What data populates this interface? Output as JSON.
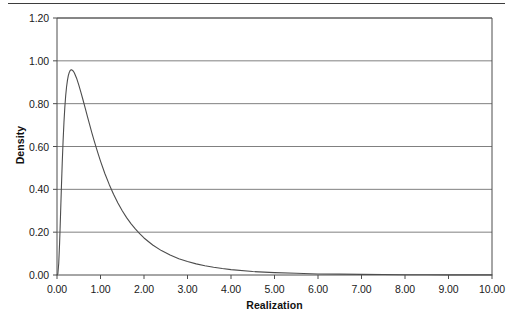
{
  "page": {
    "has_top_rule": true,
    "background": "#ffffff"
  },
  "chart_data": {
    "type": "line",
    "title": "",
    "subtitle": "",
    "xlabel": "Realization",
    "ylabel": "Density",
    "xlim": [
      0,
      10
    ],
    "ylim": [
      0,
      1.2
    ],
    "grid": "horizontal",
    "legend": null,
    "legend_position": "none",
    "line_color": "#4d4d4d",
    "grid_color": "#808080",
    "axis_color": "#4d4d4d",
    "xticks": [
      0,
      1,
      2,
      3,
      4,
      5,
      6,
      7,
      8,
      9,
      10
    ],
    "xtick_labels": [
      "0.00",
      "1.00",
      "2.00",
      "3.00",
      "4.00",
      "5.00",
      "6.00",
      "7.00",
      "8.00",
      "9.00",
      "10.00"
    ],
    "yticks": [
      0,
      0.2,
      0.4,
      0.6,
      0.8,
      1.0,
      1.2
    ],
    "ytick_labels": [
      "0.00",
      "0.20",
      "0.40",
      "0.60",
      "0.80",
      "1.00",
      "1.20"
    ],
    "series": [
      {
        "name": "Density",
        "x": [
          0.0,
          0.02,
          0.04,
          0.06,
          0.08,
          0.1,
          0.12,
          0.14,
          0.16,
          0.18,
          0.2,
          0.22,
          0.24,
          0.26,
          0.28,
          0.3,
          0.32,
          0.34,
          0.36,
          0.38,
          0.4,
          0.45,
          0.5,
          0.55,
          0.6,
          0.65,
          0.7,
          0.75,
          0.8,
          0.85,
          0.9,
          0.95,
          1.0,
          1.1,
          1.2,
          1.3,
          1.4,
          1.5,
          1.6,
          1.7,
          1.8,
          1.9,
          2.0,
          2.2,
          2.4,
          2.6,
          2.8,
          3.0,
          3.2,
          3.4,
          3.6,
          3.8,
          4.0,
          4.5,
          5.0,
          5.5,
          6.0,
          6.5,
          7.0,
          7.5,
          8.0,
          8.5,
          9.0,
          9.5,
          10.0
        ],
        "y": [
          0.0,
          0.006,
          0.055,
          0.15,
          0.273,
          0.402,
          0.522,
          0.626,
          0.713,
          0.783,
          0.838,
          0.879,
          0.909,
          0.931,
          0.945,
          0.954,
          0.958,
          0.958,
          0.955,
          0.95,
          0.943,
          0.919,
          0.888,
          0.853,
          0.816,
          0.778,
          0.74,
          0.702,
          0.665,
          0.63,
          0.596,
          0.563,
          0.532,
          0.474,
          0.423,
          0.377,
          0.336,
          0.3,
          0.268,
          0.24,
          0.215,
          0.193,
          0.173,
          0.14,
          0.114,
          0.093,
          0.076,
          0.063,
          0.052,
          0.043,
          0.036,
          0.03,
          0.025,
          0.016,
          0.011,
          0.008,
          0.005,
          0.004,
          0.003,
          0.002,
          0.0015,
          0.0011,
          0.0008,
          0.0006,
          0.0005
        ]
      }
    ],
    "peak": {
      "x": 0.33,
      "y": 0.958
    }
  },
  "plot_geometry": {
    "left_px": 57,
    "right_px": 492,
    "top_px": 18,
    "bottom_px": 275
  }
}
